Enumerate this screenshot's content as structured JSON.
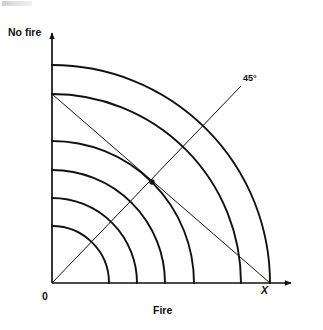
{
  "figure": {
    "title_axis_y": "No fire",
    "title_axis_x": "Fire",
    "origin_label": "0",
    "point_label_x": "X",
    "angle_label": "45°"
  },
  "chart_data": {
    "type": "line",
    "title": "",
    "xlabel": "Fire",
    "ylabel": "No fire",
    "grid": false,
    "legend": "none",
    "origin_px": [
      52,
      283
    ],
    "xlim_px": [
      52,
      297
    ],
    "ylim_px": [
      283,
      28
    ],
    "axes": {
      "x_axis": {
        "from": [
          52,
          283
        ],
        "to": [
          297,
          283
        ],
        "arrow": true
      },
      "y_axis": {
        "from": [
          52,
          283
        ],
        "to": [
          52,
          28
        ],
        "arrow": true
      }
    },
    "arcs": {
      "shape": "quarter-circle",
      "center": [
        52,
        283
      ],
      "count": 6,
      "radii": [
        57,
        85,
        113,
        142,
        189,
        218
      ],
      "x_intercepts": [
        109,
        137,
        165,
        194,
        241,
        270
      ],
      "y_intercepts": [
        226,
        198,
        170,
        141,
        94,
        65
      ]
    },
    "rays": [
      {
        "name": "45-degree-ray",
        "from": [
          52,
          283
        ],
        "to": [
          241,
          86
        ],
        "angle_deg": 45,
        "label": "45°"
      },
      {
        "name": "chord-to-X",
        "from": [
          52,
          94
        ],
        "to": [
          270,
          283
        ]
      }
    ],
    "points": [
      {
        "name": "tangency-point",
        "px": [
          152,
          182
        ],
        "label": ""
      },
      {
        "name": "X",
        "px": [
          270,
          283
        ],
        "label": "X"
      }
    ]
  },
  "style": {
    "stroke": "#111111",
    "background": "#ffffff",
    "arc_stroke_width": 1.9,
    "axis_stroke_width": 1.7,
    "ray_stroke_width": 1.0
  }
}
